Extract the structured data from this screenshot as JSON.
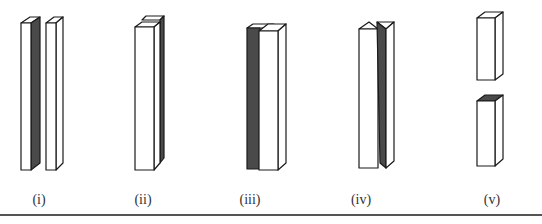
{
  "figure": {
    "panels": [
      {
        "id": "i",
        "label": "(i)",
        "description": "Two tall thin slabs side by side; left slab has dark side face"
      },
      {
        "id": "ii",
        "label": "(ii)",
        "description": "Two slabs stacked front-to-back; rear slab shows dark side"
      },
      {
        "id": "iii",
        "label": "(iii)",
        "description": "Dark slab behind a white slab, offset to the left"
      },
      {
        "id": "iv",
        "label": "(iv)",
        "description": "White slab with peaked top beside triangular prism with dark face"
      },
      {
        "id": "v",
        "label": "(v)",
        "description": "Slab split into two blocks; lower block has dark top face"
      }
    ],
    "colors": {
      "stroke": "#1a1a1a",
      "dark_face": "#4a4a4a",
      "light_face": "#ffffff",
      "rule": "#555555"
    }
  }
}
